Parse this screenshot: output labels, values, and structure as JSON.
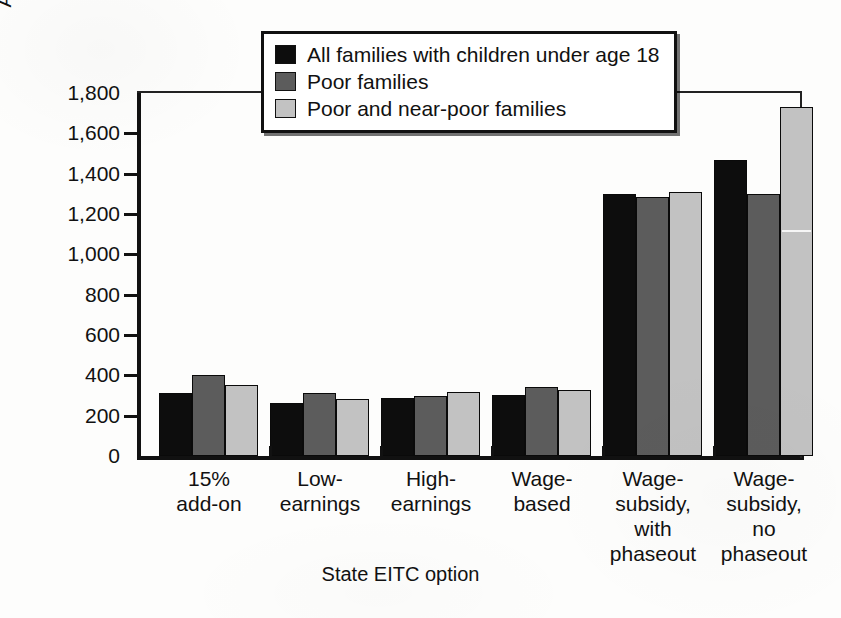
{
  "chart_data": {
    "type": "bar",
    "title": "",
    "xlabel": "State EITC option",
    "ylabel": "Average annual benefit ($)",
    "ylim": [
      0,
      1800
    ],
    "ytick_step": 200,
    "ytick_labels": [
      "0",
      "200",
      "400",
      "600",
      "800",
      "1,000",
      "1,200",
      "1,400",
      "1,600",
      "1,800"
    ],
    "ytick_values": [
      0,
      200,
      400,
      600,
      800,
      1000,
      1200,
      1400,
      1600,
      1800
    ],
    "grid": false,
    "legend_position": "top-center",
    "categories": [
      "15%\nadd-on",
      "Low-\nearnings",
      "High-\nearnings",
      "Wage-\nbased",
      "Wage-\nsubsidy,\nwith\nphaseout",
      "Wage-\nsubsidy,\nno\nphaseout"
    ],
    "series": [
      {
        "name": "All families with children under age 18",
        "color": "#0d0d0d",
        "values": [
          310,
          265,
          290,
          305,
          1300,
          1470
        ]
      },
      {
        "name": "Poor families",
        "color": "#5c5c5c",
        "values": [
          400,
          310,
          300,
          340,
          1285,
          1300
        ]
      },
      {
        "name": "Poor and near-poor families",
        "color": "#c2c2c2",
        "values": [
          350,
          285,
          315,
          325,
          1310,
          1730
        ]
      }
    ]
  }
}
